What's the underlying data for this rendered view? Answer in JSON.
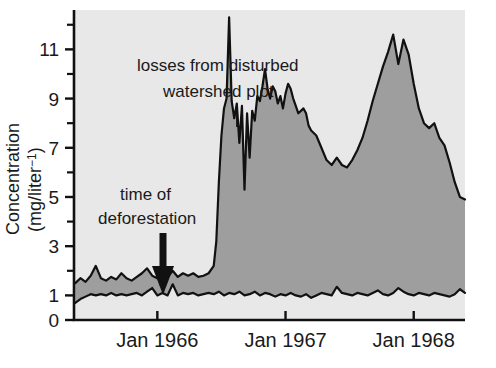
{
  "figure": {
    "background_color": "#ffffff",
    "plot_background_color": "#e8e8e8",
    "band_fill_color": "#9e9e9e",
    "line_color": "#111111",
    "axis_color": "#111111"
  },
  "axes": {
    "y_axis_title_line1": "Concentration",
    "y_axis_title_line2": "(mg/liter",
    "y_axis_title_exponent": "−1",
    "y_axis_title_close": ")",
    "y_tick_labels": [
      "11",
      "9",
      "7",
      "5",
      "3",
      "1",
      "0"
    ],
    "y_tick_values": [
      11,
      9,
      7,
      5,
      3,
      1,
      0
    ],
    "y_minor_tick_values": [
      12,
      10,
      8,
      6,
      4,
      2
    ],
    "x_tick_labels": [
      "Jan 1966",
      "Jan 1967",
      "Jan 1968"
    ],
    "x_tick_values": [
      1966.0,
      1967.0,
      1968.0
    ],
    "ylim": [
      0,
      12.6
    ],
    "xlim": [
      1965.35,
      1968.4
    ],
    "grid": false,
    "legend": "none"
  },
  "annotations": [
    {
      "name": "disturbed-watershed-annotation",
      "line1": "losses from disturbed",
      "line2": "watershed plot",
      "leader_line": true
    },
    {
      "name": "deforestation-annotation",
      "line1": "time of",
      "line2": "deforestation",
      "arrow": "down-arrow"
    }
  ],
  "chart_data": {
    "type": "area",
    "title": "",
    "xlabel": "",
    "ylabel": "Concentration (mg/liter⁻¹)",
    "xlim": [
      1965.35,
      1968.4
    ],
    "ylim": [
      0,
      12.6
    ],
    "grid": false,
    "legend_position": "none",
    "x_tick_labels": [
      "Jan 1966",
      "Jan 1967",
      "Jan 1968"
    ],
    "y_tick_labels": [
      "0",
      "1",
      "3",
      "5",
      "7",
      "9",
      "11"
    ],
    "series": [
      {
        "name": "disturbed watershed plot",
        "role": "upper-boundary",
        "x": [
          1965.36,
          1965.4,
          1965.44,
          1965.48,
          1965.52,
          1965.56,
          1965.6,
          1965.64,
          1965.68,
          1965.72,
          1965.76,
          1965.8,
          1965.84,
          1965.88,
          1965.92,
          1965.96,
          1966.0,
          1966.04,
          1966.08,
          1966.12,
          1966.16,
          1966.2,
          1966.24,
          1966.28,
          1966.32,
          1966.36,
          1966.4,
          1966.44,
          1966.46,
          1966.48,
          1966.5,
          1966.52,
          1966.54,
          1966.56,
          1966.58,
          1966.6,
          1966.62,
          1966.64,
          1966.66,
          1966.68,
          1966.7,
          1966.72,
          1966.74,
          1966.76,
          1966.78,
          1966.8,
          1966.82,
          1966.84,
          1966.86,
          1966.88,
          1966.9,
          1966.92,
          1966.94,
          1966.96,
          1966.98,
          1967.0,
          1967.02,
          1967.04,
          1967.06,
          1967.08,
          1967.1,
          1967.12,
          1967.14,
          1967.16,
          1967.18,
          1967.2,
          1967.24,
          1967.28,
          1967.32,
          1967.36,
          1967.4,
          1967.44,
          1967.48,
          1967.52,
          1967.56,
          1967.6,
          1967.64,
          1967.68,
          1967.72,
          1967.76,
          1967.8,
          1967.84,
          1967.88,
          1967.92,
          1967.96,
          1968.0,
          1968.04,
          1968.08,
          1968.12,
          1968.16,
          1968.2,
          1968.24,
          1968.28,
          1968.32,
          1968.36,
          1968.4
        ],
        "y": [
          1.5,
          1.7,
          1.55,
          1.8,
          2.2,
          1.7,
          1.6,
          1.75,
          1.65,
          1.9,
          1.7,
          1.6,
          1.75,
          1.9,
          2.1,
          1.8,
          1.7,
          1.85,
          1.75,
          2.0,
          1.75,
          1.9,
          1.8,
          1.9,
          1.75,
          1.8,
          1.9,
          2.2,
          3.2,
          5.6,
          7.5,
          8.6,
          9.0,
          12.3,
          8.9,
          8.2,
          8.8,
          7.2,
          8.7,
          5.3,
          8.4,
          6.6,
          8.5,
          8.1,
          9.1,
          8.9,
          9.5,
          10.2,
          9.4,
          9.0,
          9.5,
          9.3,
          8.8,
          9.1,
          8.6,
          9.2,
          9.6,
          9.4,
          9.0,
          8.7,
          8.4,
          8.5,
          8.6,
          8.4,
          7.9,
          7.7,
          7.5,
          7.0,
          6.5,
          6.3,
          6.6,
          6.3,
          6.2,
          6.5,
          6.9,
          7.4,
          8.1,
          8.9,
          9.6,
          10.3,
          10.9,
          11.6,
          10.4,
          11.4,
          10.8,
          9.6,
          8.6,
          8.0,
          7.8,
          8.0,
          7.4,
          7.1,
          6.4,
          5.6,
          5.0,
          4.9
        ]
      },
      {
        "name": "undisturbed control watershed",
        "role": "lower-boundary",
        "x": [
          1965.36,
          1965.4,
          1965.44,
          1965.48,
          1965.52,
          1965.56,
          1965.6,
          1965.64,
          1965.68,
          1965.72,
          1965.76,
          1965.8,
          1965.84,
          1965.88,
          1965.92,
          1965.96,
          1966.0,
          1966.04,
          1966.08,
          1966.12,
          1966.16,
          1966.2,
          1966.24,
          1966.28,
          1966.32,
          1966.36,
          1966.4,
          1966.44,
          1966.48,
          1966.52,
          1966.56,
          1966.6,
          1966.64,
          1966.68,
          1966.72,
          1966.76,
          1966.8,
          1966.84,
          1966.88,
          1966.92,
          1966.96,
          1967.0,
          1967.04,
          1967.08,
          1967.12,
          1967.16,
          1967.2,
          1967.24,
          1967.28,
          1967.32,
          1967.36,
          1967.4,
          1967.44,
          1967.48,
          1967.52,
          1967.56,
          1967.6,
          1967.64,
          1967.68,
          1967.72,
          1967.76,
          1967.8,
          1967.84,
          1967.88,
          1967.92,
          1967.96,
          1968.0,
          1968.04,
          1968.08,
          1968.12,
          1968.16,
          1968.2,
          1968.24,
          1968.28,
          1968.32,
          1968.36,
          1968.4
        ],
        "y": [
          0.7,
          0.85,
          0.95,
          1.05,
          1.0,
          1.05,
          1.0,
          1.1,
          1.0,
          1.05,
          1.0,
          1.05,
          1.1,
          1.0,
          1.15,
          1.3,
          1.0,
          1.1,
          1.0,
          1.45,
          1.0,
          1.1,
          1.05,
          1.1,
          1.0,
          1.05,
          1.1,
          1.05,
          1.15,
          1.0,
          1.1,
          1.05,
          1.15,
          1.0,
          1.05,
          1.15,
          1.0,
          1.1,
          1.05,
          0.95,
          1.05,
          1.0,
          1.1,
          1.0,
          0.95,
          1.05,
          0.9,
          1.0,
          1.1,
          1.05,
          1.0,
          1.35,
          1.1,
          1.05,
          1.0,
          1.1,
          1.05,
          1.0,
          1.1,
          1.2,
          1.05,
          1.0,
          1.1,
          1.3,
          1.15,
          1.05,
          1.0,
          1.1,
          1.05,
          1.0,
          1.1,
          1.05,
          1.0,
          0.95,
          1.05,
          1.25,
          1.1
        ]
      }
    ]
  }
}
